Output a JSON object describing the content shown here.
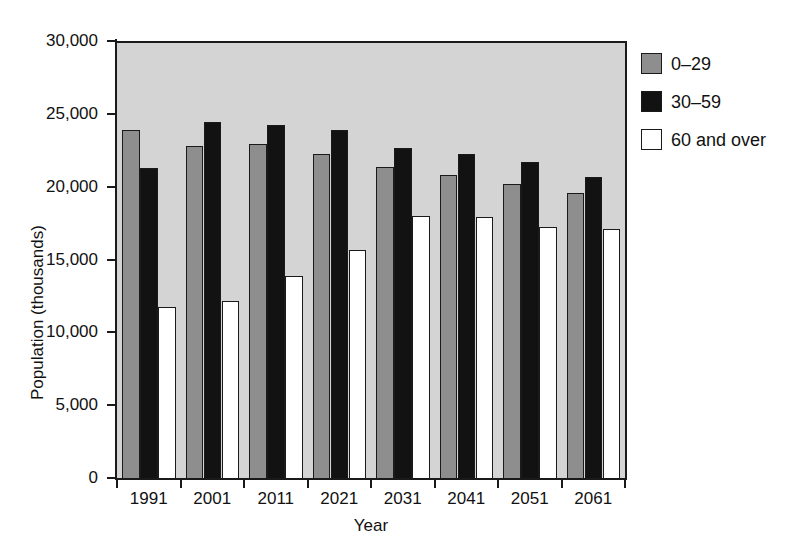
{
  "figure": {
    "top_cut_text": "",
    "background": "#ffffff",
    "plot_background": "#d4d4d4",
    "axis_color": "#1a1a1a"
  },
  "chart_data": {
    "type": "bar",
    "title": "",
    "xlabel": "Year",
    "ylabel": "Population (thousands)",
    "categories": [
      "1991",
      "2001",
      "2011",
      "2021",
      "2031",
      "2041",
      "2051",
      "2061"
    ],
    "ylim": [
      0,
      30000
    ],
    "yticks": [
      0,
      5000,
      10000,
      15000,
      20000,
      25000,
      30000
    ],
    "ytick_labels": [
      "0",
      "5,000",
      "10,000",
      "15,000",
      "20,000",
      "25,000",
      "30,000"
    ],
    "grid": false,
    "legend_position": "right",
    "series": [
      {
        "name": "0–29",
        "color": "#8e8e8e",
        "values": [
          24050,
          22950,
          23050,
          22350,
          21500,
          20950,
          20350,
          19700
        ]
      },
      {
        "name": "30–59",
        "color": "#121212",
        "values": [
          21400,
          24600,
          24400,
          24050,
          22800,
          22350,
          21800,
          20800
        ]
      },
      {
        "name": "60 and over",
        "color": "#ffffff",
        "values": [
          11900,
          12300,
          14000,
          15800,
          18150,
          18050,
          17400,
          17250
        ]
      }
    ]
  },
  "legend": {
    "items": [
      {
        "label": "0–29",
        "swatch": "gray"
      },
      {
        "label": "30–59",
        "swatch": "black"
      },
      {
        "label": "60 and over",
        "swatch": "white"
      }
    ]
  }
}
